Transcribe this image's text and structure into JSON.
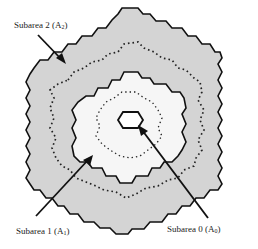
{
  "diagram": {
    "colors": {
      "outer_fill": "#d4d4d4",
      "inner_fill": "#f6f6f6",
      "center_fill": "#ffffff",
      "outline": "#111111",
      "dots": "#222222",
      "background": "#ffffff"
    },
    "labels": [
      {
        "id": "subarea-2",
        "text": "Subarea 2 (A",
        "sub": "2",
        "close": ")"
      },
      {
        "id": "subarea-1",
        "text": "Subarea 1 (A",
        "sub": "1",
        "close": ")"
      },
      {
        "id": "subarea-0",
        "text": "Subarea 0 (A",
        "sub": "0",
        "close": ")"
      }
    ]
  }
}
